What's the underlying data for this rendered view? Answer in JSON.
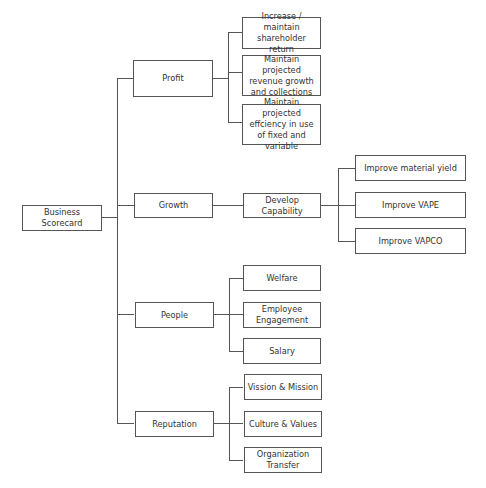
{
  "root": {
    "label": "Business Scorecard"
  },
  "branches": [
    {
      "label": "Profit",
      "children": [
        "Increase / maintain shareholder return",
        "Maintain projected revenue growth and collections",
        "Maintain projected effciency in use of fixed and variable"
      ]
    },
    {
      "label": "Growth",
      "intermediate": "Develop Capability",
      "children": [
        "Improve material yield",
        "Improve VAPE",
        "Improve VAPCO"
      ]
    },
    {
      "label": "People",
      "children": [
        "Welfare",
        "Employee Engagement",
        "Salary"
      ]
    },
    {
      "label": "Reputation",
      "children": [
        "Vission & Mission",
        "Culture & Values",
        "Organization Transfer"
      ]
    }
  ]
}
